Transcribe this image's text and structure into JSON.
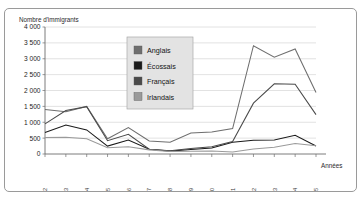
{
  "figure": {
    "y_axis_title": "Nombre d'immigrants",
    "x_axis_title": "Années"
  },
  "legend": {
    "position": "inside-top-center",
    "items": [
      {
        "label": "Anglais",
        "color": "#6e6e6e"
      },
      {
        "label": "Écossais",
        "color": "#1a1a1a"
      },
      {
        "label": "Français",
        "color": "#4a4a4a"
      },
      {
        "label": "Irlandais",
        "color": "#9a9a9a"
      }
    ]
  },
  "chart_data": {
    "type": "line",
    "title": "",
    "xlabel": "Années",
    "ylabel": "Nombre d'immigrants",
    "ylim": [
      0,
      4000
    ],
    "ytick_labels": [
      "0",
      "500",
      "1 000",
      "1 500",
      "2 000",
      "2 500",
      "3 000",
      "3 500",
      "4 000"
    ],
    "yticks": [
      0,
      500,
      1000,
      1500,
      2000,
      2500,
      3000,
      3500,
      4000
    ],
    "grid": true,
    "legend_position": "inside-top-center",
    "categories": [
      "1871-72",
      "1872-73",
      "1873-74",
      "1874-75",
      "1875-76",
      "1876-77",
      "1877-78",
      "1878-79",
      "1879-80",
      "1880-81",
      "1881-82",
      "1882-83",
      "1883-84",
      "1884-85"
    ],
    "series": [
      {
        "name": "Anglais",
        "color": "#6e6e6e",
        "values": [
          1400,
          1330,
          1500,
          480,
          830,
          410,
          370,
          660,
          690,
          800,
          3410,
          3050,
          3310,
          1940
        ]
      },
      {
        "name": "Écossais",
        "color": "#1a1a1a",
        "values": [
          680,
          910,
          760,
          250,
          440,
          150,
          90,
          140,
          190,
          370,
          430,
          440,
          590,
          250
        ]
      },
      {
        "name": "Français",
        "color": "#4a4a4a",
        "values": [
          950,
          1370,
          1490,
          420,
          620,
          150,
          100,
          175,
          230,
          390,
          1600,
          2210,
          2200,
          1240
        ]
      },
      {
        "name": "Irlandais",
        "color": "#9a9a9a",
        "values": [
          520,
          530,
          480,
          200,
          230,
          130,
          80,
          85,
          95,
          60,
          160,
          215,
          330,
          260
        ]
      }
    ]
  }
}
